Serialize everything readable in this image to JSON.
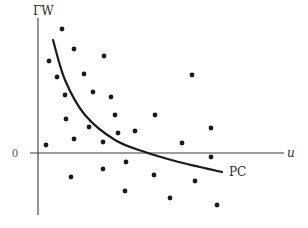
{
  "chart_data": {
    "type": "scatter",
    "title": "",
    "xlabel": "u",
    "ylabel": "ΓW",
    "y_tick_labels": [
      "0"
    ],
    "grid": false,
    "legend": null,
    "annotations": [
      {
        "text": "PC",
        "target": "curve"
      }
    ],
    "series": [
      {
        "name": "points",
        "kind": "scatter",
        "points_px": [
          [
            62,
            29
          ],
          [
            74,
            49
          ],
          [
            49,
            61
          ],
          [
            104,
            56
          ],
          [
            57,
            77
          ],
          [
            84,
            74
          ],
          [
            65,
            95
          ],
          [
            93,
            92
          ],
          [
            111,
            97
          ],
          [
            66,
            119
          ],
          [
            89,
            127
          ],
          [
            74,
            139
          ],
          [
            46,
            145
          ],
          [
            103,
            142
          ],
          [
            115,
            115
          ],
          [
            155,
            115
          ],
          [
            118,
            133
          ],
          [
            135,
            131
          ],
          [
            192,
            75
          ],
          [
            211,
            128
          ],
          [
            182,
            143
          ],
          [
            211,
            157
          ],
          [
            71,
            177
          ],
          [
            103,
            169
          ],
          [
            126,
            162
          ],
          [
            125,
            191
          ],
          [
            154,
            175
          ],
          [
            170,
            198
          ],
          [
            195,
            181
          ],
          [
            217,
            205
          ]
        ]
      },
      {
        "name": "PC",
        "kind": "curve",
        "description": "decreasing convex curve crossing the u-axis",
        "path_px": [
          [
            53,
            40
          ],
          [
            65,
            80
          ],
          [
            85,
            115
          ],
          [
            115,
            140
          ],
          [
            145,
            152
          ],
          [
            175,
            161
          ],
          [
            200,
            167
          ],
          [
            222,
            172
          ]
        ]
      }
    ],
    "axes": {
      "origin_px": [
        38,
        153
      ],
      "x_axis_end_px": 284,
      "y_axis_top_px": 18,
      "y_axis_bottom_px": 215
    }
  },
  "labels": {
    "y_axis": "ΓW",
    "x_axis": "u",
    "zero": "0",
    "curve": "PC"
  }
}
